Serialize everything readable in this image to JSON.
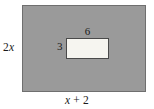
{
  "figure": {
    "type": "geometry-diagram",
    "colors": {
      "outer_fill": "#9a9a9a",
      "outer_stroke": "#6f6f6f",
      "inner_fill": "#f6f5f0",
      "inner_stroke": "#4a4a4a",
      "background": "#ffffff",
      "text": "#1a1a1a"
    },
    "outer_rectangle": {
      "name": "outer-rectangle",
      "width_label": "x + 2",
      "width_label_parts": {
        "variable": "x",
        "operator": "+",
        "constant": "2"
      },
      "height_label": "2x",
      "height_label_parts": {
        "coefficient": "2",
        "variable": "x"
      },
      "width_label_position": "bottom",
      "height_label_position": "left"
    },
    "inner_rectangle": {
      "name": "inner-rectangle",
      "width_label": "6",
      "height_label": "3",
      "width_label_position": "top",
      "height_label_position": "left"
    }
  }
}
